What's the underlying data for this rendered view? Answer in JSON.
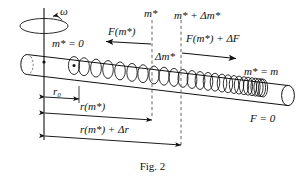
{
  "figure": {
    "caption": "Fig. 2"
  },
  "labels": {
    "omega": "ω",
    "mass_zero": "m* = 0",
    "mass_star": "m*",
    "mass_star_plus_delta": "m* + Δm*",
    "force_m_star": "F(m*)",
    "force_m_star_plus_df": "F(m*) + ΔF",
    "delta_m_star": "Δm*",
    "mass_equals_m": "m* = m",
    "force_zero": "F = 0",
    "r_zero": "r₀",
    "r_of_m_star": "r(m*)",
    "r_of_m_star_plus_dr": "r(m*) + Δr"
  },
  "colors": {
    "ink": "#111111",
    "background": "#ffffff",
    "dashed": "#555555"
  },
  "geometry": {
    "axis_x": 44,
    "dash_line_1_x": 152,
    "dash_line_2_x": 181,
    "tube_left_x": 22,
    "tube_right_x": 288
  }
}
